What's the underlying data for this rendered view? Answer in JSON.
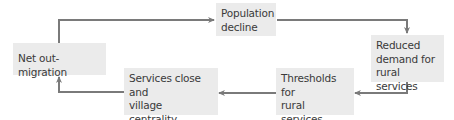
{
  "diagram": {
    "type": "cycle",
    "nodes": [
      {
        "id": "population",
        "label": "Population decline",
        "lines": [
          "Population",
          "decline"
        ]
      },
      {
        "id": "reduced",
        "label": "Reduced demand for rural services",
        "lines": [
          "Reduced",
          "demand for",
          "rural services"
        ]
      },
      {
        "id": "thresholds",
        "label": "Thresholds for rural services undermined",
        "lines": [
          "Thresholds for",
          "rural services",
          "undermined"
        ]
      },
      {
        "id": "services",
        "label": "Services close and village centrality declines",
        "lines": [
          "Services close and",
          "village centrality",
          "declines"
        ]
      },
      {
        "id": "netout",
        "label": "Net out-migration",
        "lines": [
          "Net out-migration"
        ]
      }
    ],
    "edges": [
      {
        "from": "netout",
        "to": "population"
      },
      {
        "from": "population",
        "to": "reduced"
      },
      {
        "from": "reduced",
        "to": "thresholds"
      },
      {
        "from": "thresholds",
        "to": "services"
      },
      {
        "from": "services",
        "to": "netout"
      }
    ],
    "colors": {
      "box_fill": "#ebebeb",
      "arrow": "#7a7a7a",
      "text": "#3a3a3a"
    }
  }
}
